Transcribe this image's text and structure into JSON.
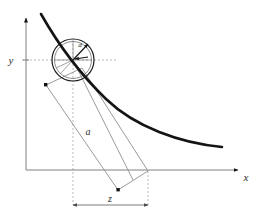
{
  "figure": {
    "kind": "technical-line-diagram",
    "background_color": "#ffffff",
    "width": 264,
    "height": 220
  },
  "labels": {
    "x_axis": "x",
    "y_axis": "y",
    "rod_length": "a",
    "horizontal_offset": "z",
    "radius": "d"
  },
  "colors": {
    "curve": "#141414",
    "axis": "#808080",
    "guide": "#b9b9b9",
    "rod": "#9a9a9a",
    "circle": "#1a1a1a",
    "dimension": "#7d7d7d",
    "text": "#2b2b2b"
  },
  "geometry": {
    "origin": {
      "x": 26,
      "y": 170
    },
    "y_axis_top": {
      "x": 26,
      "y": 14
    },
    "x_axis_right": {
      "x": 244,
      "y": 170
    },
    "circle_center": {
      "x": 73,
      "y": 60
    },
    "circle_radius": 21,
    "circle_inner_radius": 19,
    "curve_start": {
      "x": 41,
      "y": 14
    },
    "curve_end": {
      "x": 222,
      "y": 146
    },
    "rod_top_left": {
      "x": 46,
      "y": 85
    },
    "rod_top_right": {
      "x": 82,
      "y": 68
    },
    "rod_bottom_right": {
      "x": 148,
      "y": 171
    },
    "rod_bottom_left": {
      "x": 118,
      "y": 190
    },
    "dim_line_y": 205,
    "dim_left_x": 73,
    "dim_right_x": 148,
    "y_tick": {
      "x": 26,
      "y": 60
    }
  },
  "elements": {
    "curve_name": "tangent-curve",
    "circle_name": "disk",
    "rod_name": "rod",
    "radius_vector_name": "radius-vector",
    "normal_vector_name": "normal-vector"
  }
}
